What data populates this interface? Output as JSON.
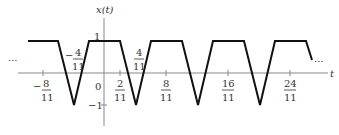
{
  "diagram": {
    "y_axis_label": "x(t)",
    "x_axis_label": "t",
    "ellipsis_left": "...",
    "ellipsis_right": "...",
    "y_ticks": [
      {
        "label": "1",
        "value": 1
      },
      {
        "label": "−1",
        "value": -1
      }
    ],
    "origin_label": "0",
    "x_ticks": [
      {
        "sign": "−",
        "num": "8",
        "den": "11",
        "value": -0.7273
      },
      {
        "sign": "",
        "num": "2",
        "den": "11",
        "value": 0.1818
      },
      {
        "sign": "",
        "num": "8",
        "den": "11",
        "value": 0.7273
      },
      {
        "sign": "",
        "num": "16",
        "den": "11",
        "value": 1.4545
      },
      {
        "sign": "",
        "num": "24",
        "den": "11",
        "value": 2.1818
      }
    ],
    "annotations": [
      {
        "sign": "−",
        "num": "4",
        "den": "11",
        "value": -0.3636
      },
      {
        "sign": "",
        "num": "4",
        "den": "11",
        "value": 0.3636
      }
    ],
    "line_color": "#111111",
    "axis_color": "#777777"
  }
}
